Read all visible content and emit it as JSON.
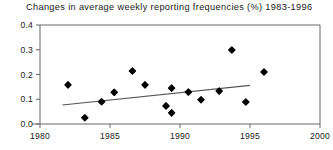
{
  "chart_data": {
    "type": "scatter",
    "title": "Changes in average weekly reporting frequencies (%) 1983-1996",
    "xlabel": "",
    "ylabel": "",
    "xlim": [
      1980,
      2000
    ],
    "ylim": [
      0.0,
      0.4
    ],
    "xticks": [
      1980,
      1985,
      1990,
      1995,
      2000
    ],
    "xtick_labels": [
      "1980",
      "1985",
      "1990",
      "1995",
      "2000"
    ],
    "yticks": [
      0.0,
      0.1,
      0.2,
      0.3,
      0.4
    ],
    "ytick_labels": [
      "0.0",
      "0.1",
      "0.2",
      "0.3",
      "0.4"
    ],
    "grid": false,
    "legend": null,
    "marker": "diamond",
    "marker_color": "#000000",
    "line_color": "#555555",
    "axis_color": "#666666",
    "points": [
      {
        "x": 1982.0,
        "y": 0.158
      },
      {
        "x": 1983.2,
        "y": 0.025
      },
      {
        "x": 1984.4,
        "y": 0.09
      },
      {
        "x": 1985.3,
        "y": 0.128
      },
      {
        "x": 1986.6,
        "y": 0.214
      },
      {
        "x": 1987.5,
        "y": 0.158
      },
      {
        "x": 1989.0,
        "y": 0.073
      },
      {
        "x": 1989.4,
        "y": 0.145
      },
      {
        "x": 1989.4,
        "y": 0.045
      },
      {
        "x": 1990.6,
        "y": 0.129
      },
      {
        "x": 1991.5,
        "y": 0.098
      },
      {
        "x": 1992.8,
        "y": 0.133
      },
      {
        "x": 1993.7,
        "y": 0.299
      },
      {
        "x": 1994.7,
        "y": 0.089
      },
      {
        "x": 1996.0,
        "y": 0.21
      }
    ],
    "trend_line": {
      "x1": 1981.6,
      "y1": 0.077,
      "x2": 1995.0,
      "y2": 0.156
    }
  }
}
